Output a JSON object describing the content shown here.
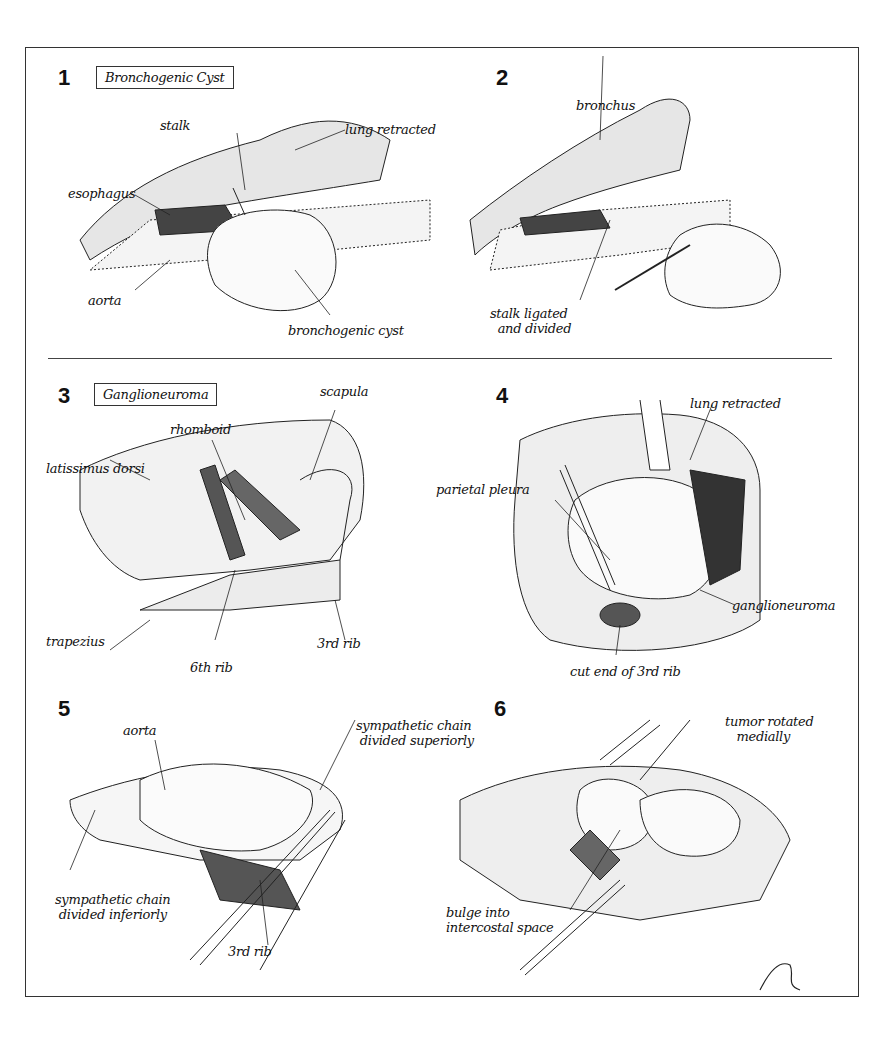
{
  "figure": {
    "panels": [
      {
        "number": "1",
        "title": "Bronchogenic Cyst",
        "labels": [
          "stalk",
          "lung retracted",
          "esophagus",
          "aorta",
          "bronchogenic cyst"
        ]
      },
      {
        "number": "2",
        "title": "",
        "labels": [
          "bronchus",
          "stalk ligated\n  and divided"
        ]
      },
      {
        "number": "3",
        "title": "Ganglioneuroma",
        "labels": [
          "scapula",
          "rhomboid",
          "latissimus dorsi",
          "trapezius",
          "6th rib",
          "3rd rib"
        ]
      },
      {
        "number": "4",
        "title": "",
        "labels": [
          "lung retracted",
          "parietal pleura",
          "ganglioneuroma",
          "cut end of 3rd rib"
        ]
      },
      {
        "number": "5",
        "title": "",
        "labels": [
          "aorta",
          "sympathetic chain\n divided superiorly",
          "sympathetic chain\n divided inferiorly",
          "3rd rib"
        ]
      },
      {
        "number": "6",
        "title": "",
        "labels": [
          "tumor rotated\n   medially",
          "bulge into\nintercostal space"
        ]
      }
    ],
    "signature": "Scholow MD"
  }
}
